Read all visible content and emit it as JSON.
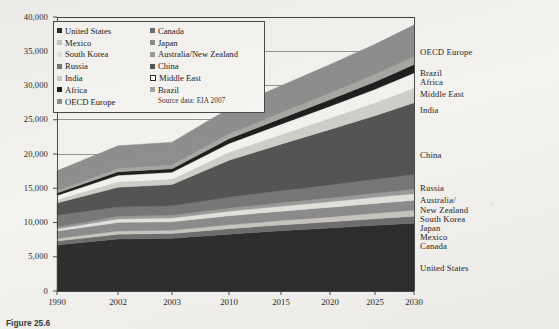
{
  "figure": {
    "caption": "Figure 25.6",
    "source_note": "Source data: EIA 2007"
  },
  "chart_data": {
    "type": "area",
    "stacked": true,
    "title": "",
    "subtitle": "",
    "xlabel": "",
    "ylabel": "",
    "grid": true,
    "legend_position": "inside-top-left",
    "x": [
      1990,
      2002,
      2003,
      2010,
      2015,
      2020,
      2025,
      2030
    ],
    "xtick_labels": [
      "1990",
      "2002",
      "2003",
      "2010",
      "2015",
      "2020",
      "2025",
      "2030"
    ],
    "ytick_labels": [
      "0",
      "5,000",
      "10,000",
      "15,000",
      "20,000",
      "25,000",
      "30,000",
      "35,000",
      "40,000"
    ],
    "ytick_values": [
      0,
      5000,
      10000,
      15000,
      20000,
      25000,
      30000,
      35000,
      40000
    ],
    "ylim": [
      0,
      40000
    ],
    "xlim": [
      1990,
      2030
    ],
    "series": [
      {
        "name": "United States",
        "color": "#2e2e2e",
        "values": [
          6700,
          7600,
          7700,
          8300,
          8800,
          9200,
          9600,
          9900
        ]
      },
      {
        "name": "Canada",
        "color": "#6e6e6e",
        "values": [
          600,
          700,
          700,
          800,
          850,
          900,
          950,
          1000
        ]
      },
      {
        "name": "Mexico",
        "color": "#c9c6c0",
        "values": [
          350,
          450,
          460,
          560,
          640,
          720,
          800,
          880
        ]
      },
      {
        "name": "Japan",
        "color": "#8c8c8c",
        "values": [
          1100,
          1250,
          1260,
          1320,
          1360,
          1400,
          1430,
          1460
        ]
      },
      {
        "name": "South Korea",
        "color": "#e3e1dc",
        "values": [
          300,
          520,
          540,
          660,
          740,
          820,
          890,
          960
        ]
      },
      {
        "name": "Australia/New Zealand",
        "color": "#9b9b9b",
        "values": [
          300,
          380,
          390,
          450,
          500,
          550,
          600,
          650
        ]
      },
      {
        "name": "Russia",
        "color": "#787878",
        "values": [
          1700,
          1350,
          1380,
          1600,
          1750,
          1900,
          2030,
          2150
        ]
      },
      {
        "name": "China",
        "color": "#545454",
        "values": [
          1800,
          2900,
          3100,
          5400,
          6800,
          8100,
          9300,
          10500
        ]
      },
      {
        "name": "India",
        "color": "#cfcdc7",
        "values": [
          500,
          800,
          830,
          1150,
          1400,
          1650,
          1900,
          2150
        ]
      },
      {
        "name": "Middle East",
        "color": "#f2f1ee",
        "values": [
          600,
          950,
          980,
          1300,
          1520,
          1740,
          1960,
          2180
        ]
      },
      {
        "name": "Africa",
        "color": "#1f1f1f",
        "values": [
          350,
          500,
          520,
          700,
          830,
          960,
          1090,
          1220
        ]
      },
      {
        "name": "Brazil",
        "color": "#a8a6a1",
        "values": [
          350,
          500,
          520,
          700,
          830,
          950,
          1080,
          1200
        ]
      },
      {
        "name": "OECD Europe",
        "color": "#8e8e8e",
        "values": [
          2900,
          3300,
          3350,
          3700,
          3950,
          4180,
          4400,
          4600
        ]
      }
    ],
    "legend_left_column": [
      {
        "label": "United States",
        "swatch": "#2e2e2e",
        "style": "filled"
      },
      {
        "label": "Mexico",
        "swatch": "#c9c6c0",
        "style": "faint"
      },
      {
        "label": "South Korea",
        "swatch": "#e3e1dc",
        "style": "faint"
      },
      {
        "label": "Russia",
        "swatch": "#787878",
        "style": "filled"
      },
      {
        "label": "India",
        "swatch": "#cfcdc7",
        "style": "faint"
      },
      {
        "label": "Africa",
        "swatch": "#1f1f1f",
        "style": "filled"
      },
      {
        "label": "OECD Europe",
        "swatch": "#8e8e8e",
        "style": "filled"
      }
    ],
    "legend_right_column": [
      {
        "label": "Canada",
        "swatch": "#6e6e6e",
        "style": "filled"
      },
      {
        "label": "Japan",
        "swatch": "#8c8c8c",
        "style": "faint"
      },
      {
        "label": "Australia/New Zealand",
        "swatch": "#9b9b9b",
        "style": "filled"
      },
      {
        "label": "China",
        "swatch": "#545454",
        "style": "filled"
      },
      {
        "label": "Middle East",
        "swatch": "#ffffff",
        "style": "hollow"
      },
      {
        "label": "Brazil",
        "swatch": "#a8a6a1",
        "style": "faint"
      }
    ],
    "right_callouts": [
      {
        "label": "OECD Europe",
        "y": 52
      },
      {
        "label": "Brazil",
        "y": 73
      },
      {
        "label": "Africa",
        "y": 82
      },
      {
        "label": "Middle East",
        "y": 94
      },
      {
        "label": "India",
        "y": 110
      },
      {
        "label": "China",
        "y": 155
      },
      {
        "label": "Russia",
        "y": 188
      },
      {
        "label": "Australia/",
        "y": 200
      },
      {
        "label": "New Zealand",
        "y": 210
      },
      {
        "label": "South Korea",
        "y": 219
      },
      {
        "label": "Japan",
        "y": 228
      },
      {
        "label": "Mexico",
        "y": 237
      },
      {
        "label": "Canada",
        "y": 246
      },
      {
        "label": "United States",
        "y": 268
      }
    ]
  }
}
